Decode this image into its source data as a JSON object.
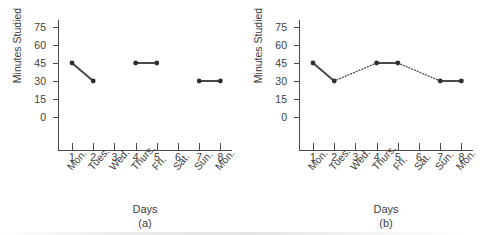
{
  "figure": {
    "background_color": "#ffffff",
    "ink_color": "#3c3c3c",
    "line_color": "#4a4a4a"
  },
  "chart_data": [
    {
      "type": "line",
      "title": "",
      "caption": "(a)",
      "xlabel": "Days",
      "ylabel": "Minutes Studied",
      "x": [
        1,
        2,
        3,
        4,
        5,
        6,
        7,
        8
      ],
      "categories": [
        "Mon.",
        "Tues.",
        "Wed.",
        "Thurs.",
        "Fri.",
        "Sat.",
        "Sun.",
        "Mon."
      ],
      "xticklabels": [
        "1",
        "2",
        "3",
        "4",
        "5",
        "6",
        "7",
        "8"
      ],
      "yticks": [
        0,
        15,
        30,
        45,
        60,
        75
      ],
      "yticklabels": [
        "0",
        "15",
        "30",
        "45",
        "60",
        "75"
      ],
      "ylim": [
        0,
        75
      ],
      "xlim": [
        1,
        8
      ],
      "grid": false,
      "legend": "none",
      "points": [
        {
          "x": 1,
          "y": 45
        },
        {
          "x": 2,
          "y": 30
        },
        {
          "x": 4,
          "y": 45
        },
        {
          "x": 5,
          "y": 45
        },
        {
          "x": 7,
          "y": 30
        },
        {
          "x": 8,
          "y": 30
        }
      ],
      "segments": [
        {
          "from": {
            "x": 1,
            "y": 45
          },
          "to": {
            "x": 2,
            "y": 30
          },
          "style": "solid"
        },
        {
          "from": {
            "x": 4,
            "y": 45
          },
          "to": {
            "x": 5,
            "y": 45
          },
          "style": "solid"
        },
        {
          "from": {
            "x": 7,
            "y": 30
          },
          "to": {
            "x": 8,
            "y": 30
          },
          "style": "solid"
        }
      ]
    },
    {
      "type": "line",
      "title": "",
      "caption": "(b)",
      "xlabel": "Days",
      "ylabel": "Minutes Studied",
      "x": [
        1,
        2,
        3,
        4,
        5,
        6,
        7,
        8
      ],
      "categories": [
        "Mon.",
        "Tues.",
        "Wed.",
        "Thurs.",
        "Fri.",
        "Sat.",
        "Sun.",
        "Mon."
      ],
      "xticklabels": [
        "1",
        "2",
        "3",
        "4",
        "5",
        "6",
        "7",
        "8"
      ],
      "yticks": [
        0,
        15,
        30,
        45,
        60,
        75
      ],
      "yticklabels": [
        "0",
        "15",
        "30",
        "45",
        "60",
        "75"
      ],
      "ylim": [
        0,
        75
      ],
      "xlim": [
        1,
        8
      ],
      "grid": false,
      "legend": "none",
      "points": [
        {
          "x": 1,
          "y": 45
        },
        {
          "x": 2,
          "y": 30
        },
        {
          "x": 4,
          "y": 45
        },
        {
          "x": 5,
          "y": 45
        },
        {
          "x": 7,
          "y": 30
        },
        {
          "x": 8,
          "y": 30
        }
      ],
      "segments": [
        {
          "from": {
            "x": 1,
            "y": 45
          },
          "to": {
            "x": 2,
            "y": 30
          },
          "style": "solid"
        },
        {
          "from": {
            "x": 2,
            "y": 30
          },
          "to": {
            "x": 4,
            "y": 45
          },
          "style": "dotted"
        },
        {
          "from": {
            "x": 4,
            "y": 45
          },
          "to": {
            "x": 5,
            "y": 45
          },
          "style": "solid"
        },
        {
          "from": {
            "x": 5,
            "y": 45
          },
          "to": {
            "x": 7,
            "y": 30
          },
          "style": "dotted"
        },
        {
          "from": {
            "x": 7,
            "y": 30
          },
          "to": {
            "x": 8,
            "y": 30
          },
          "style": "solid"
        }
      ]
    }
  ]
}
